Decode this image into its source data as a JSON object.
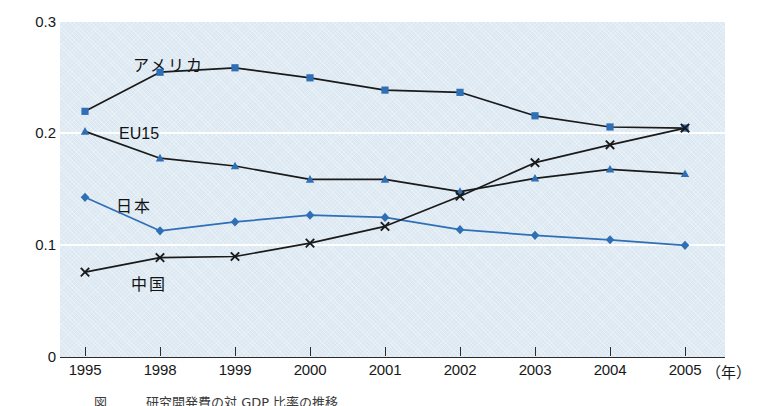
{
  "chart_data": {
    "type": "line",
    "title": "",
    "subtitle": "",
    "xlabel": "年",
    "ylabel": "",
    "x": [
      "1995",
      "1998",
      "1999",
      "2000",
      "2001",
      "2002",
      "2003",
      "2004",
      "2005"
    ],
    "xlim": [
      0,
      8
    ],
    "ylim": [
      0,
      0.3
    ],
    "yticks": [
      "0",
      "0.1",
      "0.2",
      "0.3"
    ],
    "ytick_values": [
      0,
      0.1,
      0.2,
      0.3
    ],
    "grid": true,
    "grid_orientation": "horizontal",
    "legend": "inline-annotations",
    "series": [
      {
        "name": "アメリカ",
        "marker": "square",
        "color": "#2f6fb5",
        "line_color": "#1a1a1a",
        "values": [
          0.22,
          0.255,
          0.259,
          0.25,
          0.239,
          0.237,
          0.216,
          0.206,
          0.205
        ]
      },
      {
        "name": "EU15",
        "marker": "triangle",
        "color": "#2f6fb5",
        "line_color": "#1a1a1a",
        "values": [
          0.202,
          0.178,
          0.171,
          0.159,
          0.159,
          0.148,
          0.16,
          0.168,
          0.164
        ]
      },
      {
        "name": "日本",
        "marker": "diamond",
        "color": "#2f6fb5",
        "line_color": "#2f6fb5",
        "values": [
          0.143,
          0.113,
          0.121,
          0.127,
          0.125,
          0.114,
          0.109,
          0.105,
          0.1
        ]
      },
      {
        "name": "中国",
        "marker": "cross",
        "color": "#1a1a1a",
        "line_color": "#1a1a1a",
        "values": [
          0.076,
          0.089,
          0.09,
          0.102,
          0.117,
          0.144,
          0.174,
          0.19,
          0.205
        ]
      }
    ],
    "annotations": [
      {
        "text": "アメリカ",
        "x_px": 133,
        "y_px": 52
      },
      {
        "text": "EU15",
        "x_px": 119,
        "y_px": 125
      },
      {
        "text": "日本",
        "x_px": 116,
        "y_px": 193
      },
      {
        "text": "中国",
        "x_px": 131,
        "y_px": 271
      }
    ]
  },
  "axis": {
    "y_ticks": [
      {
        "label": "0.3",
        "value": 0.3
      },
      {
        "label": "0.2",
        "value": 0.2
      },
      {
        "label": "0.1",
        "value": 0.1
      },
      {
        "label": "0",
        "value": 0
      }
    ],
    "x_ticks": [
      {
        "label": "1995"
      },
      {
        "label": "1998"
      },
      {
        "label": "1999"
      },
      {
        "label": "2000"
      },
      {
        "label": "2001"
      },
      {
        "label": "2002"
      },
      {
        "label": "2003"
      },
      {
        "label": "2004"
      },
      {
        "label": "2005"
      }
    ],
    "x_unit": "（年）"
  },
  "caption": {
    "text": "図　　　研究開発費の対 GDP 比率の推移"
  },
  "colors": {
    "plot_background": "#dbe8f2",
    "gridline": "#ffffff",
    "marker_blue": "#2f6fb5",
    "line_dark": "#1a1a1a",
    "line_blue": "#2f6fb5",
    "text": "#16181a"
  }
}
